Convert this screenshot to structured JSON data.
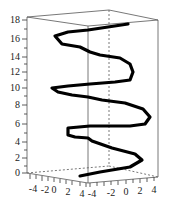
{
  "chart_data": {
    "type": "line",
    "subtype": "3d-space-curve",
    "title": "",
    "xlabel": "",
    "ylabel": "",
    "zlabel": "",
    "x_ticks": [
      "-4",
      "-2",
      "0",
      "2",
      "4"
    ],
    "y_ticks": [
      "-4",
      "-2",
      "0",
      "2",
      "4"
    ],
    "z_ticks": [
      "0",
      "2",
      "4",
      "6",
      "8",
      "10",
      "12",
      "14",
      "16",
      "18"
    ],
    "xlim": [
      -4,
      4
    ],
    "ylim": [
      -4,
      4
    ],
    "zlim": [
      0,
      18
    ],
    "grid": false,
    "legend": null,
    "box": true,
    "series": [
      {
        "name": "space curve",
        "color": "#000000",
        "description": "helix-like curve winding upward from z≈0.5 to z≈18, oscillating in x/y with radius ≈ 3",
        "points_2d_screen": [
          [
            80,
            176
          ],
          [
            100,
            172
          ],
          [
            130,
            167
          ],
          [
            142,
            160
          ],
          [
            135,
            154
          ],
          [
            112,
            148
          ],
          [
            92,
            141
          ],
          [
            88,
            138
          ],
          [
            75,
            137
          ],
          [
            68,
            135
          ],
          [
            68,
            128
          ],
          [
            90,
            126
          ],
          [
            112,
            126
          ],
          [
            130,
            126
          ],
          [
            145,
            124
          ],
          [
            150,
            117
          ],
          [
            143,
            109
          ],
          [
            125,
            103
          ],
          [
            102,
            100
          ],
          [
            88,
            97
          ],
          [
            72,
            95
          ],
          [
            58,
            92
          ],
          [
            52,
            88
          ],
          [
            68,
            86
          ],
          [
            90,
            84
          ],
          [
            115,
            82
          ],
          [
            130,
            80
          ],
          [
            133,
            72
          ],
          [
            130,
            64
          ],
          [
            120,
            58
          ],
          [
            100,
            55
          ],
          [
            90,
            52
          ],
          [
            80,
            47
          ],
          [
            62,
            44
          ],
          [
            55,
            36
          ],
          [
            68,
            32
          ],
          [
            88,
            30
          ],
          [
            108,
            27
          ],
          [
            128,
            24
          ]
        ]
      }
    ]
  },
  "axes": {
    "z_tick_labels": [
      "18",
      "16",
      "14",
      "12",
      "10",
      "8",
      "6",
      "4",
      "2",
      "0"
    ],
    "front_left_tick_labels": [
      "-4",
      "-2",
      "0",
      "2",
      "4"
    ],
    "front_right_tick_labels": [
      "-4",
      "-2",
      "0",
      "2",
      "4"
    ]
  }
}
